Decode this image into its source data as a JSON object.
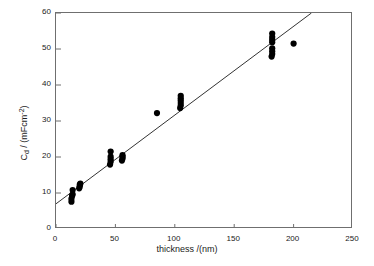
{
  "chart_data": {
    "type": "scatter",
    "title": "",
    "xlabel": "thickness /(nm)",
    "ylabel_parts": {
      "symbol": "C",
      "subscript": "d",
      "separator": " / (mFcm",
      "superscript": "-2",
      "close": ")"
    },
    "ylabel": "Cd / (mFcm-2)",
    "xlim": [
      0,
      250
    ],
    "ylim": [
      0,
      60
    ],
    "xticks": [
      0,
      50,
      100,
      150,
      200,
      250
    ],
    "yticks": [
      0,
      10,
      20,
      30,
      40,
      50,
      60
    ],
    "xtick_labels": [
      "0",
      "50",
      "100",
      "150",
      "200",
      "250"
    ],
    "ytick_labels": [
      "0",
      "10",
      "20",
      "30",
      "40",
      "50",
      "60"
    ],
    "grid": false,
    "legend": null,
    "marker": {
      "shape": "circle",
      "color": "#000000",
      "size": 5
    },
    "fit_line": {
      "type": "linear",
      "color": "#333333",
      "intercept": 7.0,
      "slope": 0.2465,
      "x_start": 0,
      "x_end": 215
    },
    "points": [
      {
        "x": 13,
        "y": 7.6
      },
      {
        "x": 13,
        "y": 8.4
      },
      {
        "x": 13.5,
        "y": 9.2
      },
      {
        "x": 14,
        "y": 9.6
      },
      {
        "x": 14,
        "y": 10.8
      },
      {
        "x": 19.5,
        "y": 11.3
      },
      {
        "x": 20,
        "y": 11.8
      },
      {
        "x": 20,
        "y": 12.3
      },
      {
        "x": 20.5,
        "y": 12.6
      },
      {
        "x": 45.5,
        "y": 17.9
      },
      {
        "x": 46,
        "y": 18.7
      },
      {
        "x": 46,
        "y": 19.4
      },
      {
        "x": 46,
        "y": 20.1
      },
      {
        "x": 46,
        "y": 21.5
      },
      {
        "x": 55.5,
        "y": 19.0
      },
      {
        "x": 56,
        "y": 19.6
      },
      {
        "x": 56,
        "y": 20.1
      },
      {
        "x": 56,
        "y": 20.5
      },
      {
        "x": 85,
        "y": 32.2
      },
      {
        "x": 104.5,
        "y": 33.6
      },
      {
        "x": 105,
        "y": 34.3
      },
      {
        "x": 105,
        "y": 35.0
      },
      {
        "x": 105,
        "y": 35.7
      },
      {
        "x": 105,
        "y": 36.3
      },
      {
        "x": 105,
        "y": 37.0
      },
      {
        "x": 181.5,
        "y": 47.9
      },
      {
        "x": 182,
        "y": 48.6
      },
      {
        "x": 182,
        "y": 49.4
      },
      {
        "x": 182,
        "y": 50.2
      },
      {
        "x": 182,
        "y": 51.9
      },
      {
        "x": 182,
        "y": 52.6
      },
      {
        "x": 182,
        "y": 53.3
      },
      {
        "x": 182,
        "y": 54.3
      },
      {
        "x": 200,
        "y": 51.5
      }
    ]
  }
}
